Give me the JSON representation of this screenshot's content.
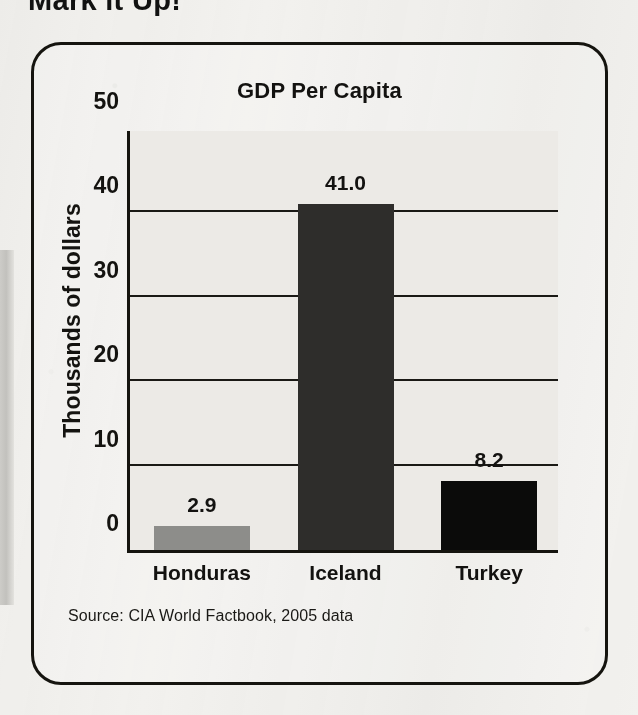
{
  "page": {
    "heading": "Mark it Up!",
    "background_color": "#f2f1ee"
  },
  "figure": {
    "border_color": "#15140f",
    "source_note": "Source: CIA World Factbook, 2005 data"
  },
  "chart_data": {
    "type": "bar",
    "title": "GDP Per Capita",
    "xlabel": "",
    "ylabel": "Thousands of dollars",
    "categories": [
      "Honduras",
      "Iceland",
      "Turkey"
    ],
    "values": [
      2.9,
      41.0,
      8.2
    ],
    "value_labels": [
      "2.9",
      "41.0",
      "8.2"
    ],
    "bar_colors": [
      "#8d8d8a",
      "#2e2d2b",
      "#0b0b0a"
    ],
    "ylim": [
      0,
      50
    ],
    "ytick_values": [
      0,
      10,
      20,
      30,
      40,
      50
    ],
    "ytick_labels": [
      "0",
      "10",
      "20",
      "30",
      "40",
      "50"
    ],
    "grid": true,
    "grid_axis": "y",
    "legend": false,
    "plot_background": "#eceae6",
    "source": "Source: CIA World Factbook, 2005 data"
  }
}
